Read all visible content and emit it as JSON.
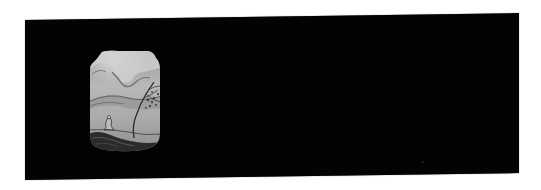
{
  "image": {
    "subject": "Black lacquer panel with painted landscape cartouche",
    "colors": {
      "background": "#ffffff",
      "lacquer": "#030303",
      "panel_light": "#c8c8c8",
      "panel_mid": "#8e8e8e",
      "panel_dark": "#2b2b2b"
    },
    "panel_scene": {
      "elements": [
        "clouds",
        "distant-hills",
        "leaning-tree",
        "seated-figure",
        "rocky-ground"
      ]
    }
  }
}
